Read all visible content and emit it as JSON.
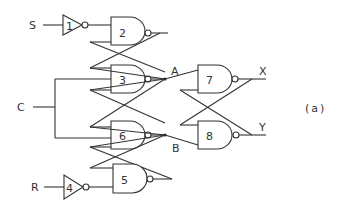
{
  "figure_label": "(a)",
  "inputs": {
    "S": "S",
    "C": "C",
    "R": "R"
  },
  "outputs": {
    "X": "X",
    "Y": "Y"
  },
  "nodes": {
    "A": "A",
    "B": "B"
  },
  "gates": [
    {
      "id": "1",
      "type": "NOT",
      "label": "1"
    },
    {
      "id": "2",
      "type": "NAND",
      "label": "2"
    },
    {
      "id": "3",
      "type": "NAND",
      "label": "3"
    },
    {
      "id": "4",
      "type": "NOT",
      "label": "4"
    },
    {
      "id": "5",
      "type": "NAND",
      "label": "5"
    },
    {
      "id": "6",
      "type": "NAND",
      "label": "6"
    },
    {
      "id": "7",
      "type": "NAND",
      "label": "7"
    },
    {
      "id": "8",
      "type": "NAND",
      "label": "8"
    }
  ],
  "colors": {
    "line": "#333333",
    "background": "#ffffff"
  }
}
